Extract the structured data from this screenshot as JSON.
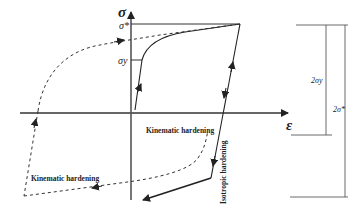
{
  "diagram": {
    "type": "stress-strain hysteresis (cyclic hardening)",
    "axes": {
      "y_label": "σ",
      "x_label": "ε"
    },
    "levels": {
      "sigma_star": "σ*",
      "sigma_y": "σy"
    },
    "annotations": {
      "kinematic_hardening_center": "Kinematic hardening",
      "kinematic_hardening_left": "Kinematic hardening",
      "isotropic_hardening": "Isotropic hardening"
    },
    "dimensions": {
      "two_sigma_y": "2σy",
      "two_sigma_star": "2σ*"
    },
    "colors": {
      "line": "#222222",
      "text": "#222222"
    }
  }
}
